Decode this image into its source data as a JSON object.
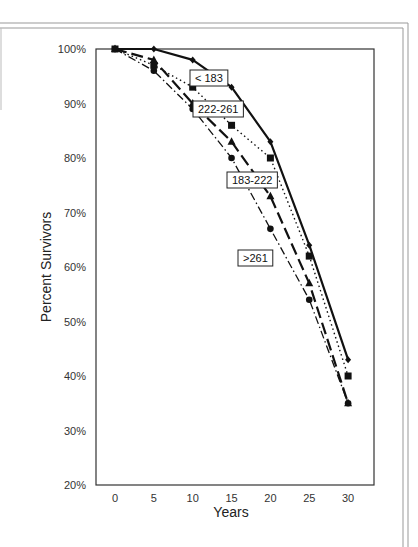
{
  "chart_data": {
    "type": "line",
    "title": "",
    "xlabel": "Years",
    "ylabel": "Percent Survivors",
    "x": [
      0,
      5,
      10,
      15,
      20,
      25,
      30
    ],
    "xticks": [
      "0",
      "5",
      "10",
      "15",
      "20",
      "25",
      "30"
    ],
    "yticks": [
      "100%",
      "90%",
      "80%",
      "70%",
      "60%",
      "50%",
      "40%",
      "30%",
      "20%"
    ],
    "ylim": [
      20,
      100
    ],
    "xlim": [
      -2.5,
      33
    ],
    "grid": false,
    "legend": "inline labels",
    "series": [
      {
        "name": "< 183",
        "marker": "diamond",
        "line": "solid",
        "values": [
          100,
          100,
          98,
          93,
          83,
          64,
          43
        ],
        "label_pos": {
          "x": 190,
          "y": 70
        }
      },
      {
        "name": "222-261",
        "marker": "square",
        "line": "dotted",
        "values": [
          100,
          97,
          93,
          86,
          80,
          62,
          40
        ],
        "label_pos": {
          "x": 193,
          "y": 101
        }
      },
      {
        "name": "183-222",
        "marker": "triangle",
        "line": "long-dash",
        "values": [
          100,
          98,
          90,
          83,
          73,
          57,
          35
        ],
        "label_pos": {
          "x": 227,
          "y": 172
        }
      },
      {
        "name": ">261",
        "marker": "circle",
        "line": "dash-dot",
        "values": [
          100,
          96,
          89,
          80,
          67,
          54,
          35
        ],
        "label_pos": {
          "x": 238,
          "y": 250
        }
      }
    ]
  }
}
